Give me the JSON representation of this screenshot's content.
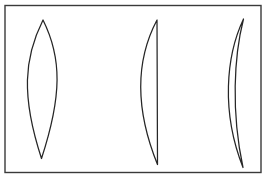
{
  "figure": {
    "background_color": "#ffffff",
    "frame": {
      "name": "outer-border",
      "x": 5,
      "y": 5.5,
      "width": 256,
      "height": 167,
      "stroke_color": "#3a3a3a",
      "fill_color": "#ffffff",
      "stroke_width": 1.4
    },
    "stroke_color": "#262626",
    "stroke_width": 1.25,
    "shapes": [
      {
        "id": "shape-1",
        "name": "symmetric-lens",
        "description": "Vesica piscis: two equal circular arcs bowing outward, meeting at a top point and a bottom point",
        "top_point": [
          43,
          20
        ],
        "bottom_point": [
          43,
          159
        ],
        "left_extent": 21,
        "right_extent": 68,
        "width": 47,
        "height": 139,
        "path": "M 43 20 C 24 58 21 96 41.5 158.5 C 62 96 62 58 43 20 Z"
      },
      {
        "id": "shape-2",
        "name": "half-lens",
        "description": "Half lens: a single circular arc bowing to the left closed by a straight vertical chord on the right",
        "top_point": [
          157,
          20
        ],
        "bottom_point": [
          157.5,
          165
        ],
        "left_extent": 133,
        "right_extent": 157.5,
        "width": 24.5,
        "height": 145,
        "path": "M 157 20 C 138 56 133 104 157.5 164.5 L 157 20 Z"
      },
      {
        "id": "shape-3",
        "name": "thin-crescent-lune",
        "description": "Thin lune: two arcs curving the same direction, the outer bowing further left, meeting at top and bottom cusps",
        "top_point": [
          243.5,
          19
        ],
        "bottom_point": [
          243,
          168
        ],
        "left_extent": 221,
        "right_extent": 244,
        "width": 23,
        "height": 149,
        "path": "M 243.5 19 C 226 56 221 112 243 167.5 C 231 112 234 56 243.5 19 Z"
      }
    ]
  }
}
